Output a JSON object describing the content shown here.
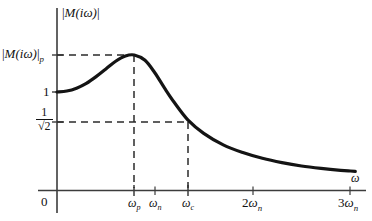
{
  "chart_data": {
    "type": "line",
    "title": "",
    "xlabel": "ω",
    "ylabel": "|M(iω)|",
    "grid": false,
    "legend": null,
    "xlim": [
      0,
      3.18
    ],
    "ylim": [
      0,
      1.52
    ],
    "x_ticks": [
      {
        "value": 0,
        "label": "0"
      },
      {
        "value": 0.79,
        "label": "ωp"
      },
      {
        "value": 1.0,
        "label": "ωn"
      },
      {
        "value": 1.34,
        "label": "ωc"
      },
      {
        "value": 2.0,
        "label": "2ωn"
      },
      {
        "value": 3.0,
        "label": "3ωn"
      }
    ],
    "y_ticks": [
      {
        "value": 1.0,
        "label": "1"
      },
      {
        "value": 0.707,
        "label": "1/√2"
      },
      {
        "value": 1.38,
        "label": "|M(iω)|p"
      }
    ],
    "annotations": [
      {
        "name": "peak-guide",
        "text": "|M(iω)|p at ωp",
        "style": "dashed"
      },
      {
        "name": "cutoff-guide",
        "text": "1/√2 at ωc",
        "style": "dashed"
      }
    ],
    "series": [
      {
        "name": "closed-loop magnitude",
        "x": [
          0.0,
          0.1,
          0.2,
          0.3,
          0.4,
          0.5,
          0.6,
          0.7,
          0.79,
          0.9,
          1.0,
          1.1,
          1.2,
          1.34,
          1.5,
          1.7,
          1.9,
          2.1,
          2.3,
          2.5,
          2.7,
          2.9,
          3.0,
          3.05
        ],
        "y": [
          1.0,
          1.01,
          1.04,
          1.09,
          1.16,
          1.24,
          1.32,
          1.375,
          1.385,
          1.33,
          1.2,
          1.04,
          0.89,
          0.707,
          0.57,
          0.45,
          0.37,
          0.31,
          0.265,
          0.23,
          0.205,
          0.185,
          0.178,
          0.175
        ]
      }
    ]
  },
  "labels": {
    "y_axis_title_open": "|",
    "y_axis_title_M": "M",
    "y_axis_title_arg": "(iω)",
    "y_axis_title_close": "|",
    "peak_label_sub": "p",
    "one": "1",
    "frac_num": "1",
    "frac_den": "√2",
    "origin": "0",
    "omega_p": "ω",
    "omega_p_sub": "p",
    "omega_n": "ω",
    "omega_n_sub": "n",
    "omega_c": "ω",
    "omega_c_sub": "c",
    "two_omega_n_coef": "2",
    "two_omega_n": "ω",
    "two_omega_n_sub": "n",
    "three_omega_n_coef": "3",
    "three_omega_n": "ω",
    "three_omega_n_sub": "n",
    "x_axis_title": "ω"
  },
  "colors": {
    "curve": "#141414",
    "axis": "#3c3c3c",
    "dashed": "#2b2b2b",
    "background": "#ffffff"
  }
}
